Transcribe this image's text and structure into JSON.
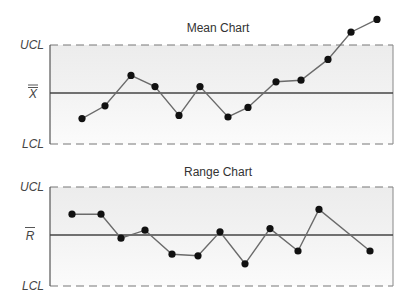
{
  "chart_data": [
    {
      "type": "line",
      "title": "Mean Chart",
      "ylabels": {
        "ucl": "UCL",
        "center": "X̄̄",
        "lcl": "LCL"
      },
      "center_symbol": "X",
      "y_scale": {
        "ucl": 3,
        "center": 0,
        "lcl": -3
      },
      "x": [
        1,
        2,
        3,
        4,
        5,
        6,
        7,
        8,
        9,
        10,
        11,
        12,
        13
      ],
      "values": [
        -1.6,
        -0.8,
        1.1,
        0.4,
        -1.4,
        0.4,
        -1.5,
        -0.9,
        0.7,
        0.8,
        2.1,
        3.8,
        4.6
      ],
      "legend": "none",
      "grid": false
    },
    {
      "type": "line",
      "title": "Range Chart",
      "ylabels": {
        "ucl": "UCL",
        "center": "R̄",
        "lcl": "LCL"
      },
      "center_symbol": "R",
      "y_scale": {
        "ucl": 3,
        "center": 0,
        "lcl": -3
      },
      "x": [
        1,
        2,
        3,
        4,
        5,
        6,
        7,
        8,
        9,
        10,
        11,
        12
      ],
      "values": [
        1.3,
        1.3,
        -0.2,
        0.3,
        -1.2,
        -1.3,
        0.2,
        -1.8,
        0.4,
        -1.0,
        1.6,
        -1.0
      ],
      "legend": "none",
      "grid": false
    }
  ],
  "mean_chart": {
    "title": "Mean Chart",
    "ucl": "UCL",
    "center": "X",
    "lcl": "LCL"
  },
  "range_chart": {
    "title": "Range Chart",
    "ucl": "UCL",
    "center": "R",
    "lcl": "LCL"
  },
  "colors": {
    "band": "#efefef",
    "line": "#6b6b6b",
    "axis": "#555555",
    "point": "#111111",
    "dash": "#777777"
  }
}
